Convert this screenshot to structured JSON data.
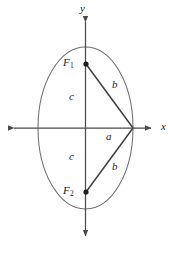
{
  "figure": {
    "type": "ellipse-geometry-diagram",
    "width": 172,
    "height": 253,
    "background_color": "#ffffff",
    "stroke_color": "#4a4a4a",
    "curve_color": "#6b6b6b",
    "label_color": "#1a1a1a"
  },
  "axes": {
    "x_label": "x",
    "y_label": "y",
    "origin": {
      "x": 85.5,
      "y": 128
    },
    "x_axis": {
      "x_start": 9,
      "x_end": 156,
      "y": 128
    },
    "y_axis": {
      "x": 85.5,
      "y_start": 17,
      "y_end": 241
    }
  },
  "ellipse": {
    "center_x": 85.5,
    "center_y": 128,
    "semi_minor_x": 47.5,
    "semi_major_y": 81,
    "left_vertex_x": 38,
    "right_vertex_x": 133,
    "top_vertex_y": 47,
    "bottom_vertex_y": 209
  },
  "points": [
    {
      "name": "F1",
      "label": "F",
      "subscript": "1",
      "x": 86,
      "y": 64
    },
    {
      "name": "F2",
      "label": "F",
      "subscript": "2",
      "x": 86,
      "y": 192
    },
    {
      "name": "right-vertex",
      "label": "",
      "subscript": "",
      "x": 133,
      "y": 128
    }
  ],
  "segments": [
    {
      "name": "f1-to-vertex",
      "label": "b",
      "x1": 86,
      "y1": 64,
      "x2": 133,
      "y2": 128
    },
    {
      "name": "f2-to-vertex",
      "label": "b",
      "x1": 86,
      "y1": 192,
      "x2": 133,
      "y2": 128
    }
  ],
  "labels": {
    "focus_upper": {
      "text": "F",
      "sub": "1",
      "x": 63,
      "y": 58
    },
    "focus_lower": {
      "text": "F",
      "sub": "2",
      "x": 63,
      "y": 186
    },
    "b_upper": {
      "text": "b",
      "x": 112,
      "y": 81
    },
    "b_lower": {
      "text": "b",
      "x": 112,
      "y": 163
    },
    "c_upper": {
      "text": "c",
      "x": 69,
      "y": 92
    },
    "c_lower": {
      "text": "c",
      "x": 69,
      "y": 152
    },
    "a_center": {
      "text": "a",
      "x": 106,
      "y": 133
    },
    "x_axis": {
      "text": "x",
      "x": 161,
      "y": 122
    },
    "y_axis": {
      "text": "y",
      "x": 80,
      "y": 4
    }
  }
}
